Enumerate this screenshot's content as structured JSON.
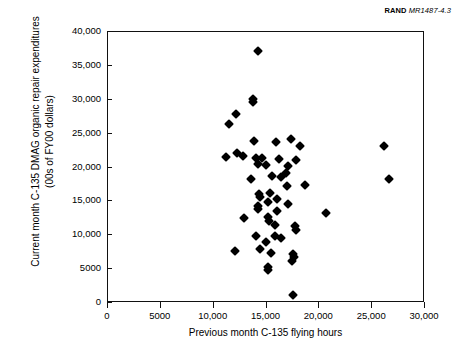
{
  "credit": {
    "org": "RAND",
    "doc_id": "MR1487-4.3"
  },
  "chart_data": {
    "type": "scatter",
    "title": "",
    "xlabel": "Previous month C-135 flying hours",
    "ylabel": "Current month C-135 DMAG organic repair expenditures (00s of FY00 dollars)",
    "xlim": [
      0,
      30000
    ],
    "ylim": [
      0,
      40000
    ],
    "xticks": [
      0,
      5000,
      10000,
      15000,
      20000,
      25000,
      30000
    ],
    "yticks": [
      0,
      5000,
      10000,
      15000,
      20000,
      25000,
      30000,
      35000,
      40000
    ],
    "xtick_labels": [
      "0",
      "5000",
      "10,000",
      "15,000",
      "20,000",
      "25,000",
      "30,000"
    ],
    "ytick_labels": [
      "0",
      "5000",
      "10,000",
      "15,000",
      "20,000",
      "25,000",
      "30,000",
      "35,000",
      "40,000"
    ],
    "grid": false,
    "legend": false,
    "marker": "diamond",
    "marker_color": "#000000",
    "series": [
      {
        "name": "C-135 monthly observations",
        "points": [
          [
            14300,
            37000
          ],
          [
            13800,
            30000
          ],
          [
            13800,
            29500
          ],
          [
            12200,
            27700
          ],
          [
            11500,
            26200
          ],
          [
            13900,
            23700
          ],
          [
            16000,
            23600
          ],
          [
            17400,
            24100
          ],
          [
            18300,
            23000
          ],
          [
            26200,
            23000
          ],
          [
            11300,
            21400
          ],
          [
            12900,
            21600
          ],
          [
            12300,
            22000
          ],
          [
            14100,
            21300
          ],
          [
            14700,
            21200
          ],
          [
            14300,
            20300
          ],
          [
            15000,
            20200
          ],
          [
            16300,
            21100
          ],
          [
            17100,
            20100
          ],
          [
            17900,
            20900
          ],
          [
            16900,
            19000
          ],
          [
            15600,
            18600
          ],
          [
            16500,
            18400
          ],
          [
            13600,
            18200
          ],
          [
            17000,
            17100
          ],
          [
            18700,
            17200
          ],
          [
            26700,
            18100
          ],
          [
            14400,
            15900
          ],
          [
            14500,
            15500
          ],
          [
            15400,
            16100
          ],
          [
            16100,
            15200
          ],
          [
            15200,
            14800
          ],
          [
            17100,
            14500
          ],
          [
            14300,
            14200
          ],
          [
            14300,
            13700
          ],
          [
            16100,
            13500
          ],
          [
            20700,
            13100
          ],
          [
            13000,
            12400
          ],
          [
            15200,
            12600
          ],
          [
            15300,
            12000
          ],
          [
            15900,
            11400
          ],
          [
            17800,
            11200
          ],
          [
            17900,
            10700
          ],
          [
            14100,
            9800
          ],
          [
            15900,
            9700
          ],
          [
            16500,
            9400
          ],
          [
            15000,
            8800
          ],
          [
            12100,
            7600
          ],
          [
            14500,
            7800
          ],
          [
            15500,
            7300
          ],
          [
            17600,
            7100
          ],
          [
            17700,
            6700
          ],
          [
            17500,
            6100
          ],
          [
            15200,
            5200
          ],
          [
            15200,
            4700
          ],
          [
            17600,
            1000
          ]
        ]
      }
    ]
  }
}
